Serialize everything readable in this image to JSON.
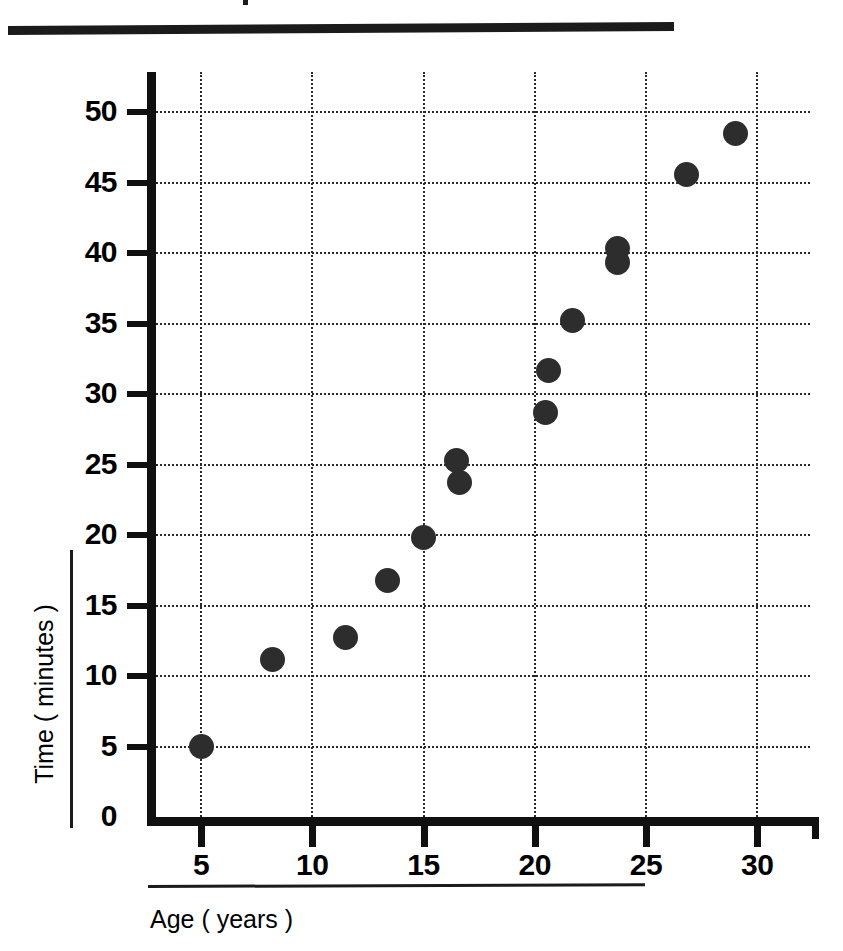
{
  "figure": {
    "title_rule": "title-underline",
    "background": "#ffffff",
    "marker_color": "#2d2d2d",
    "axis_color": "#101010",
    "grid_color": "#2a2a2a"
  },
  "axes": {
    "x_title": "Age ( years )",
    "y_title": "Time ( minutes )",
    "x_ticks": [
      "5",
      "10",
      "15",
      "20",
      "25",
      "30"
    ],
    "y_ticks": [
      "0",
      "5",
      "10",
      "15",
      "20",
      "25",
      "30",
      "35",
      "40",
      "45",
      "50"
    ]
  },
  "chart_data": {
    "type": "scatter",
    "title": "",
    "xlabel": "Age ( years )",
    "ylabel": "Time ( minutes )",
    "xlim": [
      2.4,
      32.4
    ],
    "ylim": [
      0,
      52.5
    ],
    "xticks": [
      5,
      10,
      15,
      20,
      25,
      30
    ],
    "yticks": [
      0,
      5,
      10,
      15,
      20,
      25,
      30,
      35,
      40,
      45,
      50
    ],
    "grid": true,
    "grid_style": "dotted",
    "legend": "none",
    "series": [
      {
        "name": "Age vs Time",
        "marker": "filled-circle",
        "color": "#2d2d2d",
        "points": [
          {
            "x": 5.0,
            "y": 5.0
          },
          {
            "x": 8.2,
            "y": 11.2
          },
          {
            "x": 11.5,
            "y": 12.7
          },
          {
            "x": 13.4,
            "y": 16.8
          },
          {
            "x": 15.0,
            "y": 19.8
          },
          {
            "x": 16.5,
            "y": 25.3
          },
          {
            "x": 16.6,
            "y": 23.7
          },
          {
            "x": 20.5,
            "y": 28.7
          },
          {
            "x": 20.6,
            "y": 31.7
          },
          {
            "x": 21.7,
            "y": 35.2
          },
          {
            "x": 23.7,
            "y": 40.3
          },
          {
            "x": 23.7,
            "y": 39.3
          },
          {
            "x": 26.8,
            "y": 45.6
          },
          {
            "x": 29.0,
            "y": 48.5
          }
        ]
      }
    ]
  }
}
